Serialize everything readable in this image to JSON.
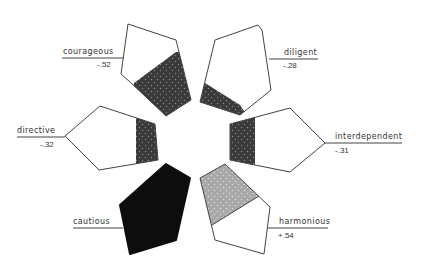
{
  "diagram": {
    "type": "trait-pentagons",
    "traits": [
      {
        "label": "courageous",
        "value": "-.52",
        "fill": "dark-dotted"
      },
      {
        "label": "diligent",
        "value": "-.28",
        "fill": "dark-dotted"
      },
      {
        "label": "directive",
        "value": "-.32",
        "fill": "dark-dotted"
      },
      {
        "label": "interdependent",
        "value": "-.31",
        "fill": "dark-dotted"
      },
      {
        "label": "cautious",
        "value": "",
        "fill": "solid-black"
      },
      {
        "label": "harmonious",
        "value": "+.54",
        "fill": "light-dotted"
      }
    ],
    "colors": {
      "dark_fill": "#3a3a3a",
      "light_fill": "#a8a8a8",
      "solid_fill": "#0d0d0d",
      "stroke": "#444444",
      "dot": "#8a8a8a"
    }
  }
}
